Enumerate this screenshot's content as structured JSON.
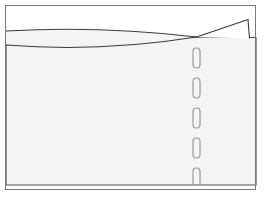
{
  "figure": {
    "title": "Sectional line drawing with tapered lens profile, corner flag and perforated seam",
    "domain_note": "monochrome technical/engineering sketch",
    "canvas": {
      "width": 274,
      "height": 205,
      "background": "#ffffff"
    },
    "colors": {
      "outline": "#7a7a7a",
      "body_outline": "#555555",
      "curve_stroke": "#3c3c3c",
      "flag_stroke": "#3c3c3c",
      "body_fill": "#f4f4f4",
      "lens_fill": "#f4f4f4",
      "flag_fill": "#ffffff",
      "perforation_stroke": "#9a9a9a",
      "page_background": "#ffffff"
    },
    "frame": {
      "name": "outer-frame",
      "x": 5.5,
      "y": 5.5,
      "width": 250,
      "height": 184,
      "stroke_width": 1
    },
    "body": {
      "name": "main-body-panel",
      "fill": "#f4f4f4",
      "stroke_width": 1.2,
      "path": "M 6 45 L 6 185 L 256 185 L 256 37.5 L 196.5 37 Z",
      "left_top_y": 45,
      "left_bottom_y": 185,
      "right_top_y": 37.5,
      "right_bottom_y": 185,
      "right_x": 256
    },
    "curves": [
      {
        "name": "upper-profile-curve",
        "label": "upper boundary",
        "start": [
          6,
          31
        ],
        "control": [
          100,
          26
        ],
        "end": [
          196.5,
          37
        ],
        "path": "M 6 31 Q 100 25.5 196.5 37",
        "stroke_width": 1.1
      },
      {
        "name": "lower-profile-curve",
        "label": "lower boundary",
        "start": [
          6,
          45
        ],
        "control": [
          100,
          52
        ],
        "end": [
          196.5,
          37
        ],
        "path": "M 6 45 Q 100 52.5 196.5 37",
        "stroke_width": 1.1
      }
    ],
    "lens": {
      "name": "lens-shaped-region",
      "fill": "#f4f4f4",
      "path": "M 6 31 Q 100 25.5 196.5 37 Q 100 52.5 6 45 Z"
    },
    "flag": {
      "name": "corner-flag-triangle",
      "fill": "#ffffff",
      "stroke_width": 1.1,
      "apex": [
        248,
        19.5
      ],
      "crossing_point": [
        196.5,
        37
      ],
      "base_right": [
        250,
        37.5
      ],
      "path": "M 196.5 37 L 248 19.5 L 249.5 38.5"
    },
    "perforation": {
      "name": "perforated-seam",
      "center_x": 196.5,
      "slot_width": 7,
      "slot_height": 20,
      "corner_radius": 3.5,
      "stroke_width": 1.2,
      "stroke": "#9a9a9a",
      "slots": [
        {
          "y": 48
        },
        {
          "y": 78
        },
        {
          "y": 108
        },
        {
          "y": 138
        },
        {
          "y": 168
        }
      ],
      "count": 5
    }
  }
}
